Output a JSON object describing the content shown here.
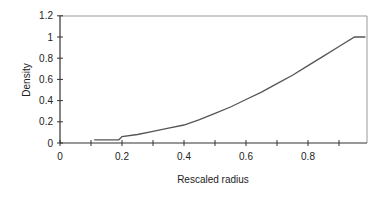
{
  "chart_data": {
    "type": "line",
    "title": "",
    "xlabel": "Rescaled radius",
    "ylabel": "Density",
    "xlim": [
      0,
      0.985
    ],
    "ylim": [
      0,
      1.2
    ],
    "x_ticks": [
      0,
      0.1,
      0.2,
      0.3,
      0.4,
      0.5,
      0.6,
      0.7,
      0.8,
      0.9
    ],
    "x_tick_labels": [
      "0",
      "",
      "0.2",
      "",
      "0.4",
      "",
      "0.6",
      "",
      "0.8",
      ""
    ],
    "y_ticks": [
      0,
      0.2,
      0.4,
      0.6,
      0.8,
      1,
      1.2
    ],
    "y_tick_labels": [
      "0",
      "0.2",
      "0.4",
      "0.6",
      "0.8",
      "1",
      "1.2"
    ],
    "grid": false,
    "legend": null,
    "series": [
      {
        "name": "Density",
        "color": "#555555",
        "x": [
          0.11,
          0.19,
          0.2,
          0.25,
          0.3,
          0.35,
          0.4,
          0.45,
          0.5,
          0.55,
          0.6,
          0.65,
          0.7,
          0.75,
          0.8,
          0.85,
          0.9,
          0.95,
          0.985
        ],
        "y": [
          0.03,
          0.03,
          0.06,
          0.08,
          0.11,
          0.14,
          0.17,
          0.22,
          0.28,
          0.34,
          0.41,
          0.48,
          0.56,
          0.64,
          0.73,
          0.82,
          0.91,
          1.0,
          1.0
        ]
      }
    ]
  }
}
